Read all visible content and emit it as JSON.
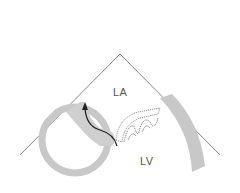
{
  "diagram": {
    "labels": {
      "la": "LA",
      "lv": "LV"
    },
    "colors": {
      "wall": "#c8c8c8",
      "line": "#555555",
      "arrow": "#222222",
      "valve_outline": "#666666"
    }
  }
}
